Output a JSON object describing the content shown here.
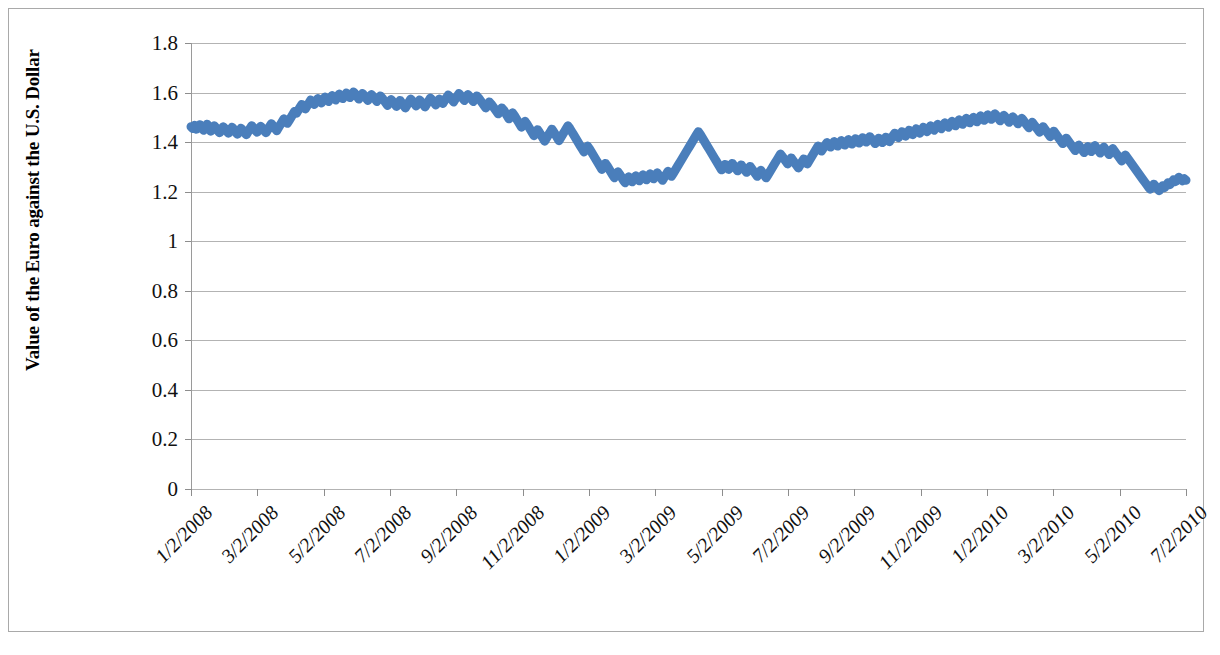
{
  "chart_data": {
    "type": "line",
    "title": "",
    "xlabel": "",
    "ylabel": "Value of the Euro against the U.S. Dollar",
    "ylim": [
      0,
      1.8
    ],
    "ytick_step": 0.2,
    "ytick_labels": [
      "1.8",
      "1.6",
      "1.4",
      "1.2",
      "1",
      "0.8",
      "0.6",
      "0.4",
      "0.2",
      "0"
    ],
    "ytick_values": [
      1.8,
      1.6,
      1.4,
      1.2,
      1.0,
      0.8,
      0.6,
      0.4,
      0.2,
      0
    ],
    "grid": true,
    "legend": false,
    "series_color": "#4a7ebb",
    "gridline_color": "#b3b3b3",
    "axis_color": "#8d8d8d",
    "border_color": "#a9a9a9",
    "line_width": 9,
    "xtick_labels": [
      "1/2/2008",
      "3/2/2008",
      "5/2/2008",
      "7/2/2008",
      "9/2/2008",
      "11/2/2008",
      "1/2/2009",
      "3/2/2009",
      "5/2/2009",
      "7/2/2009",
      "9/2/2009",
      "11/2/2009",
      "1/2/2010",
      "3/2/2010",
      "5/2/2010",
      "7/2/2010"
    ],
    "x_range": [
      "1/2/2008",
      "7/2/2010"
    ],
    "series": [
      {
        "name": "EUR/USD",
        "values": [
          1.462,
          1.455,
          1.468,
          1.452,
          1.46,
          1.47,
          1.458,
          1.448,
          1.462,
          1.472,
          1.456,
          1.444,
          1.452,
          1.466,
          1.458,
          1.446,
          1.438,
          1.45,
          1.462,
          1.455,
          1.444,
          1.436,
          1.448,
          1.46,
          1.452,
          1.44,
          1.432,
          1.444,
          1.456,
          1.448,
          1.438,
          1.43,
          1.442,
          1.455,
          1.466,
          1.458,
          1.448,
          1.44,
          1.452,
          1.464,
          1.456,
          1.446,
          1.438,
          1.45,
          1.463,
          1.474,
          1.466,
          1.455,
          1.446,
          1.458,
          1.47,
          1.482,
          1.494,
          1.486,
          1.476,
          1.488,
          1.5,
          1.512,
          1.524,
          1.516,
          1.528,
          1.54,
          1.552,
          1.544,
          1.534,
          1.546,
          1.558,
          1.57,
          1.562,
          1.552,
          1.564,
          1.576,
          1.568,
          1.558,
          1.57,
          1.582,
          1.574,
          1.564,
          1.576,
          1.588,
          1.58,
          1.57,
          1.582,
          1.594,
          1.586,
          1.576,
          1.588,
          1.598,
          1.59,
          1.58,
          1.592,
          1.602,
          1.594,
          1.584,
          1.574,
          1.586,
          1.596,
          1.588,
          1.578,
          1.568,
          1.58,
          1.592,
          1.584,
          1.574,
          1.564,
          1.576,
          1.586,
          1.578,
          1.568,
          1.558,
          1.548,
          1.56,
          1.572,
          1.564,
          1.554,
          1.544,
          1.556,
          1.568,
          1.558,
          1.548,
          1.538,
          1.55,
          1.562,
          1.574,
          1.566,
          1.556,
          1.546,
          1.558,
          1.57,
          1.562,
          1.552,
          1.542,
          1.554,
          1.566,
          1.578,
          1.57,
          1.56,
          1.55,
          1.562,
          1.574,
          1.566,
          1.556,
          1.568,
          1.58,
          1.59,
          1.582,
          1.572,
          1.562,
          1.574,
          1.586,
          1.596,
          1.588,
          1.578,
          1.568,
          1.58,
          1.592,
          1.584,
          1.574,
          1.564,
          1.576,
          1.586,
          1.578,
          1.568,
          1.558,
          1.548,
          1.538,
          1.55,
          1.562,
          1.554,
          1.544,
          1.534,
          1.524,
          1.514,
          1.526,
          1.538,
          1.53,
          1.518,
          1.506,
          1.494,
          1.506,
          1.518,
          1.508,
          1.496,
          1.484,
          1.472,
          1.46,
          1.472,
          1.484,
          1.474,
          1.462,
          1.45,
          1.438,
          1.426,
          1.438,
          1.45,
          1.44,
          1.428,
          1.416,
          1.404,
          1.416,
          1.428,
          1.44,
          1.452,
          1.442,
          1.43,
          1.418,
          1.406,
          1.418,
          1.43,
          1.442,
          1.454,
          1.466,
          1.456,
          1.444,
          1.432,
          1.42,
          1.408,
          1.396,
          1.384,
          1.372,
          1.36,
          1.372,
          1.384,
          1.374,
          1.362,
          1.35,
          1.338,
          1.326,
          1.314,
          1.302,
          1.29,
          1.302,
          1.314,
          1.304,
          1.292,
          1.28,
          1.268,
          1.256,
          1.268,
          1.28,
          1.27,
          1.258,
          1.246,
          1.236,
          1.248,
          1.26,
          1.25,
          1.24,
          1.252,
          1.264,
          1.254,
          1.244,
          1.256,
          1.268,
          1.258,
          1.248,
          1.26,
          1.272,
          1.262,
          1.252,
          1.264,
          1.276,
          1.266,
          1.256,
          1.246,
          1.258,
          1.27,
          1.282,
          1.272,
          1.262,
          1.274,
          1.286,
          1.298,
          1.31,
          1.322,
          1.334,
          1.346,
          1.358,
          1.37,
          1.382,
          1.394,
          1.406,
          1.418,
          1.43,
          1.442,
          1.432,
          1.42,
          1.408,
          1.396,
          1.384,
          1.372,
          1.36,
          1.348,
          1.336,
          1.324,
          1.312,
          1.3,
          1.288,
          1.298,
          1.31,
          1.3,
          1.29,
          1.302,
          1.314,
          1.304,
          1.294,
          1.284,
          1.296,
          1.308,
          1.298,
          1.288,
          1.278,
          1.29,
          1.302,
          1.292,
          1.282,
          1.272,
          1.262,
          1.274,
          1.286,
          1.276,
          1.266,
          1.256,
          1.268,
          1.28,
          1.292,
          1.304,
          1.316,
          1.328,
          1.34,
          1.352,
          1.342,
          1.332,
          1.322,
          1.312,
          1.324,
          1.336,
          1.326,
          1.316,
          1.306,
          1.296,
          1.308,
          1.32,
          1.332,
          1.322,
          1.312,
          1.324,
          1.336,
          1.348,
          1.36,
          1.372,
          1.384,
          1.374,
          1.364,
          1.376,
          1.388,
          1.398,
          1.39,
          1.38,
          1.392,
          1.402,
          1.394,
          1.384,
          1.396,
          1.406,
          1.398,
          1.388,
          1.4,
          1.41,
          1.402,
          1.392,
          1.404,
          1.414,
          1.406,
          1.396,
          1.408,
          1.418,
          1.41,
          1.4,
          1.412,
          1.422,
          1.414,
          1.404,
          1.394,
          1.406,
          1.416,
          1.408,
          1.398,
          1.41,
          1.42,
          1.412,
          1.402,
          1.414,
          1.426,
          1.436,
          1.428,
          1.418,
          1.43,
          1.442,
          1.434,
          1.424,
          1.436,
          1.448,
          1.44,
          1.43,
          1.442,
          1.454,
          1.446,
          1.436,
          1.448,
          1.46,
          1.452,
          1.442,
          1.454,
          1.466,
          1.458,
          1.448,
          1.46,
          1.472,
          1.464,
          1.454,
          1.466,
          1.478,
          1.47,
          1.46,
          1.472,
          1.484,
          1.476,
          1.466,
          1.478,
          1.49,
          1.482,
          1.472,
          1.484,
          1.496,
          1.488,
          1.478,
          1.49,
          1.5,
          1.492,
          1.482,
          1.494,
          1.506,
          1.498,
          1.488,
          1.5,
          1.51,
          1.502,
          1.492,
          1.504,
          1.514,
          1.506,
          1.496,
          1.486,
          1.498,
          1.508,
          1.5,
          1.49,
          1.48,
          1.492,
          1.502,
          1.494,
          1.484,
          1.474,
          1.486,
          1.496,
          1.488,
          1.478,
          1.468,
          1.458,
          1.47,
          1.48,
          1.47,
          1.46,
          1.45,
          1.44,
          1.452,
          1.462,
          1.452,
          1.442,
          1.432,
          1.422,
          1.434,
          1.444,
          1.434,
          1.424,
          1.414,
          1.404,
          1.394,
          1.406,
          1.416,
          1.406,
          1.396,
          1.386,
          1.376,
          1.366,
          1.378,
          1.388,
          1.378,
          1.368,
          1.358,
          1.37,
          1.382,
          1.372,
          1.362,
          1.374,
          1.386,
          1.376,
          1.366,
          1.356,
          1.368,
          1.38,
          1.37,
          1.36,
          1.35,
          1.362,
          1.374,
          1.364,
          1.354,
          1.344,
          1.334,
          1.324,
          1.336,
          1.348,
          1.338,
          1.328,
          1.318,
          1.308,
          1.298,
          1.288,
          1.278,
          1.268,
          1.258,
          1.248,
          1.238,
          1.228,
          1.218,
          1.21,
          1.22,
          1.23,
          1.222,
          1.212,
          1.204,
          1.214,
          1.224,
          1.216,
          1.226,
          1.236,
          1.228,
          1.238,
          1.248,
          1.24,
          1.25,
          1.258,
          1.25,
          1.244,
          1.252,
          1.246
        ]
      }
    ]
  }
}
